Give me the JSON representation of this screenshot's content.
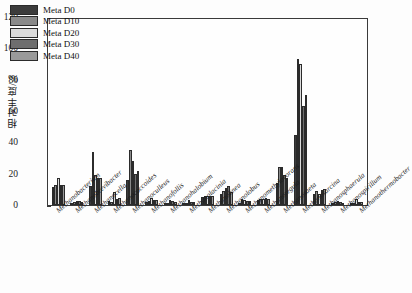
{
  "chart_data": {
    "type": "bar",
    "title": "",
    "xlabel": "",
    "ylabel": "相对丰度/‰",
    "ylim": [
      0,
      120
    ],
    "yticks": [
      "0",
      "20",
      "40",
      "60",
      "80",
      "100",
      "120"
    ],
    "grid": false,
    "legend_position": "top-left-inside",
    "categories": [
      "Methanobacterium",
      "Methanobrevibacter",
      "Methanocella",
      "Methanococcoides",
      "Methanoculleus",
      "Methanofollis",
      "Methanohalobium",
      "Methanolacinia",
      "Methanolinea",
      "Methanolobus",
      "Methanomethylovorans",
      "Methanoregula",
      "Methanosaeta",
      "Methanosarcina",
      "Methanosphaerula",
      "Methanospirillum",
      "Methanothermobacter"
    ],
    "series": [
      {
        "name": "Meta D0",
        "color": "#3c3c3c",
        "values": [
          11.5,
          1.5,
          12.0,
          2.5,
          16.0,
          2.0,
          1.0,
          1.0,
          5.0,
          7.0,
          1.0,
          3.0,
          14.0,
          45.0,
          7.0,
          1.5,
          1.0
        ]
      },
      {
        "name": "Meta D10",
        "color": "#8a8a8a",
        "values": [
          13.0,
          2.0,
          34.0,
          2.0,
          35.0,
          2.5,
          1.5,
          1.5,
          5.5,
          9.0,
          4.0,
          4.0,
          24.0,
          93.0,
          9.0,
          2.0,
          1.5
        ]
      },
      {
        "name": "Meta D20",
        "color": "#dcdcdc",
        "values": [
          17.0,
          2.5,
          19.0,
          8.0,
          28.0,
          4.5,
          3.0,
          3.5,
          6.0,
          11.0,
          3.0,
          4.0,
          24.0,
          90.0,
          7.0,
          2.5,
          4.0
        ]
      },
      {
        "name": "Meta D30",
        "color": "#6e6e6e",
        "values": [
          13.0,
          2.5,
          17.0,
          4.0,
          20.0,
          3.5,
          2.5,
          2.0,
          5.5,
          12.0,
          2.5,
          4.5,
          19.0,
          63.0,
          9.5,
          2.0,
          2.0
        ]
      },
      {
        "name": "Meta D40",
        "color": "#9a9a9a",
        "values": [
          12.5,
          2.0,
          17.5,
          4.5,
          22.0,
          3.5,
          2.0,
          2.0,
          5.5,
          8.5,
          2.5,
          4.0,
          17.0,
          70.0,
          10.0,
          1.5,
          2.0
        ]
      }
    ]
  }
}
